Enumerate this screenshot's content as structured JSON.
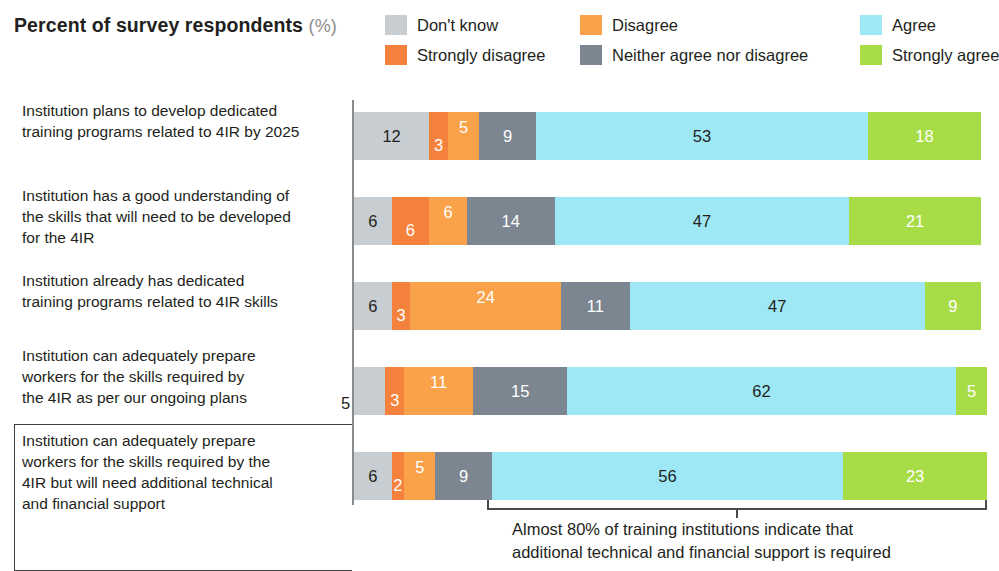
{
  "header": {
    "title": "Percent of survey respondents",
    "unit": "(%)"
  },
  "legend": {
    "items": [
      {
        "label": "Don't know",
        "color": "#c7cdd1"
      },
      {
        "label": "Strongly disagree",
        "color": "#f5823c"
      },
      {
        "label": "Disagree",
        "color": "#f9a24a"
      },
      {
        "label": "Neither agree nor disagree",
        "color": "#7c8691"
      },
      {
        "label": "Agree",
        "color": "#9ee8f5"
      },
      {
        "label": "Strongly agree",
        "color": "#a8dc46"
      }
    ]
  },
  "annotation": {
    "line1": "Almost 80% of training institutions indicate that",
    "line2": "additional technical and financial support is required"
  },
  "chart_data": {
    "type": "bar",
    "title": "Percent of survey respondents (%)",
    "xlabel": "",
    "ylabel": "",
    "xlim": [
      0,
      100
    ],
    "grid": false,
    "orientation": "horizontal",
    "stacked": true,
    "legend_position": "top-right",
    "categories": [
      "Institution plans to develop dedicated training programs related to 4IR by 2025",
      "Institution has a good understanding of the skills that will need to be developed for the 4IR",
      "Institution already has dedicated training programs related to 4IR skills",
      "Institution can adequately prepare workers for the skills required by the 4IR as per our ongoing plans",
      "Institution can adequately prepare workers for the skills required by the 4IR but will need additional technical and financial support"
    ],
    "category_lines": [
      [
        "Institution plans to develop dedicated",
        "training programs related to 4IR by 2025"
      ],
      [
        "Institution has a good understanding of",
        "the skills that will need to be developed",
        "for the 4IR"
      ],
      [
        "Institution already has dedicated",
        "training programs related to 4IR skills"
      ],
      [
        "Institution can adequately prepare",
        "workers for the skills required by",
        "the 4IR as per our ongoing plans"
      ],
      [
        "Institution can adequately prepare",
        "workers for the skills required by the",
        "4IR but will need additional technical",
        "and financial support"
      ]
    ],
    "series": [
      {
        "name": "Don't know",
        "color": "#c7cdd1",
        "values": [
          12,
          6,
          6,
          5,
          6
        ]
      },
      {
        "name": "Strongly disagree",
        "color": "#f5823c",
        "values": [
          3,
          6,
          3,
          3,
          2
        ]
      },
      {
        "name": "Disagree",
        "color": "#f9a24a",
        "values": [
          5,
          6,
          24,
          11,
          5
        ]
      },
      {
        "name": "Neither agree nor disagree",
        "color": "#7c8691",
        "values": [
          9,
          14,
          11,
          15,
          9
        ]
      },
      {
        "name": "Agree",
        "color": "#9ee8f5",
        "values": [
          53,
          47,
          47,
          62,
          56
        ]
      },
      {
        "name": "Strongly agree",
        "color": "#a8dc46",
        "values": [
          18,
          21,
          9,
          5,
          23
        ]
      }
    ],
    "annotation": "Almost 80% of training institutions indicate that additional technical and financial support is required"
  }
}
